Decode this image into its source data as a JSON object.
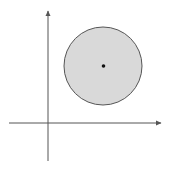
{
  "diagram": {
    "axes": {
      "x_axis_label": "",
      "y_axis_label": "",
      "arrowheads": [
        "x-positive",
        "y-positive"
      ]
    },
    "disk": {
      "fill_color": "#d9d9d9",
      "stroke_color": "#555555",
      "center_marked": true
    },
    "colors": {
      "axis": "#555555",
      "center_point": "#111111",
      "background": "#ffffff"
    }
  }
}
